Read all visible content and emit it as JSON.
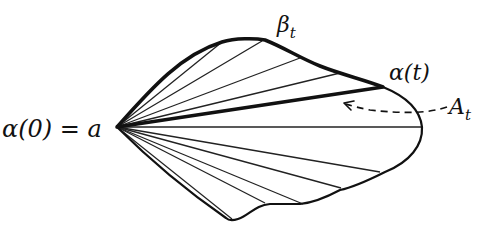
{
  "diagram": {
    "labels": {
      "origin": "α(0) = a",
      "beta_main": "β",
      "beta_sub": "t",
      "alpha_t": "α(t)",
      "area_main": "A",
      "area_sub": "t"
    },
    "colors": {
      "stroke": "#111111",
      "background": "#ffffff"
    }
  }
}
